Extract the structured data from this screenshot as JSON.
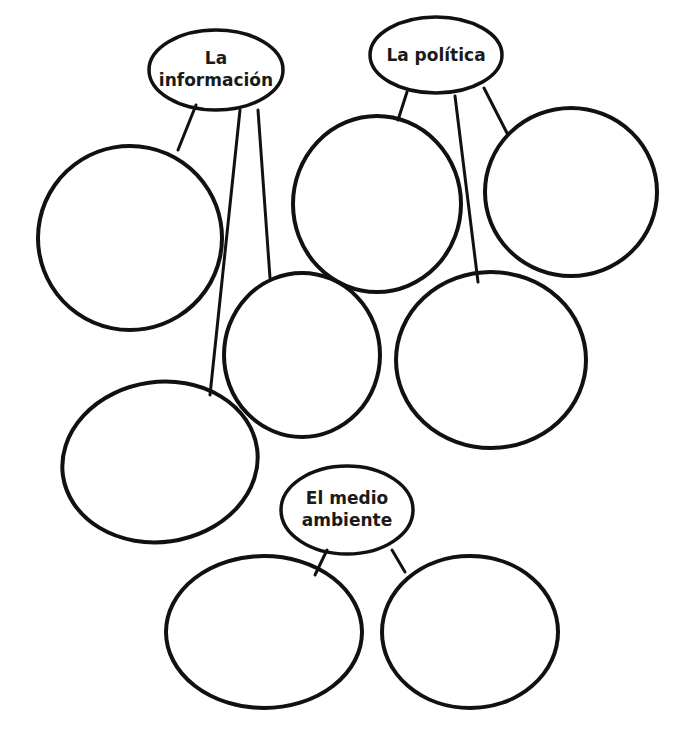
{
  "diagram": {
    "type": "word-web",
    "hubs": [
      {
        "id": "informacion",
        "label_line1": "La",
        "label_line2": "información",
        "child_bubbles": 3
      },
      {
        "id": "politica",
        "label_line1": "La política",
        "label_line2": "",
        "child_bubbles": 3
      },
      {
        "id": "medio_ambiente",
        "label_line1": "El medio",
        "label_line2": "ambiente",
        "child_bubbles": 2
      }
    ],
    "colors": {
      "stroke": "#111111",
      "background": "#ffffff",
      "text": "#1a1a1a"
    }
  }
}
